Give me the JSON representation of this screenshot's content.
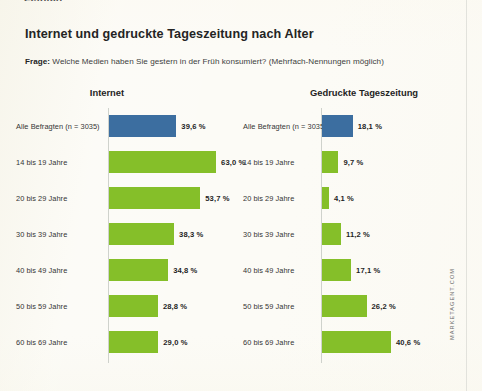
{
  "page": {
    "cropped_header_text": "Zeitlich",
    "title": "Internet und gedruckte Tageszeitung nach Alter",
    "subtitle_lead": "Frage:",
    "subtitle_text": " Welche Medien haben Sie gestern in der Früh konsumiert? (Mehrfach-Nennungen möglich)",
    "watermark": "MARKETAGENT.COM",
    "colors": {
      "background": "#fcfbf6",
      "blue_bar": "#3c6ea0",
      "green_bar": "#85bf29",
      "axis": "#cfd2cc",
      "title_text": "#242424"
    }
  },
  "chart_data": [
    {
      "type": "bar",
      "title": "Internet",
      "orientation": "horizontal",
      "xlabel": "",
      "ylabel": "",
      "xlim": [
        0,
        70
      ],
      "grid": false,
      "legend": "none",
      "value_suffix": " %",
      "categories": [
        "Alle Befragten (n = 3035)",
        "14 bis 19 Jahre",
        "20 bis 29 Jahre",
        "30 bis 39 Jahre",
        "40 bis 49 Jahre",
        "50 bis 59 Jahre",
        "60 bis 69 Jahre"
      ],
      "values": [
        39.6,
        63.0,
        53.7,
        38.3,
        34.8,
        28.8,
        29.0
      ],
      "labels": [
        "39,6 %",
        "63,0 %",
        "53,7 %",
        "38,3 %",
        "34,8 %",
        "28,8 %",
        "29,0 %"
      ],
      "bar_colors": [
        "#3c6ea0",
        "#85bf29",
        "#85bf29",
        "#85bf29",
        "#85bf29",
        "#85bf29",
        "#85bf29"
      ]
    },
    {
      "type": "bar",
      "title": "Gedruckte Tageszeitung",
      "orientation": "horizontal",
      "xlabel": "",
      "ylabel": "",
      "xlim": [
        0,
        70
      ],
      "grid": false,
      "legend": "none",
      "value_suffix": " %",
      "categories": [
        "Alle Befragten (n = 3035)",
        "14 bis 19 Jahre",
        "20 bis 29 Jahre",
        "30 bis 39 Jahre",
        "40 bis 49 Jahre",
        "50 bis 59 Jahre",
        "60 bis 69 Jahre"
      ],
      "values": [
        18.1,
        9.7,
        4.1,
        11.2,
        17.1,
        26.2,
        40.6
      ],
      "labels": [
        "18,1 %",
        "9,7 %",
        "4,1 %",
        "11,2 %",
        "17,1 %",
        "26,2 %",
        "40,6 %"
      ],
      "bar_colors": [
        "#3c6ea0",
        "#85bf29",
        "#85bf29",
        "#85bf29",
        "#85bf29",
        "#85bf29",
        "#85bf29"
      ]
    }
  ]
}
